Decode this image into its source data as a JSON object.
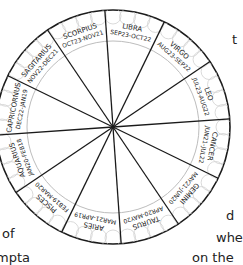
{
  "diagram": {
    "colors": {
      "line": "#1a1a1a",
      "inner_ring": "#bdbdbd",
      "scallop": "#d0d0d0",
      "background": "#ffffff"
    },
    "signs": [
      {
        "name": "LIBRA",
        "dates": "SEP23-OCT22"
      },
      {
        "name": "VIRGO",
        "dates": "AUG23-SEP22"
      },
      {
        "name": "LEO",
        "dates": "JUL23-AUG22"
      },
      {
        "name": "CANCER",
        "dates": "JUN21-JUL22"
      },
      {
        "name": "GEMINI",
        "dates": "MAY21-JUN20"
      },
      {
        "name": "TAURUS",
        "dates": "APR20-MAY20"
      },
      {
        "name": "ARIES",
        "dates": "MAR21-APR19"
      },
      {
        "name": "PISCES",
        "dates": "FEB19-MAR20"
      },
      {
        "name": "AQUARIUS",
        "dates": "JAN20-FEB18"
      },
      {
        "name": "CAPRICORNUS",
        "dates": "DEC22-JAN19"
      },
      {
        "name": "SAGITARIUS",
        "dates": "NOV22-DEC21"
      },
      {
        "name": "SCORPIUS",
        "dates": "OCT23-NOV21"
      }
    ]
  },
  "text_fragments": {
    "right_top": "t",
    "right_mid": "d",
    "right_low": "whe",
    "right_bottom": "on the",
    "left_low": "of",
    "left_bottom": "mpta"
  }
}
